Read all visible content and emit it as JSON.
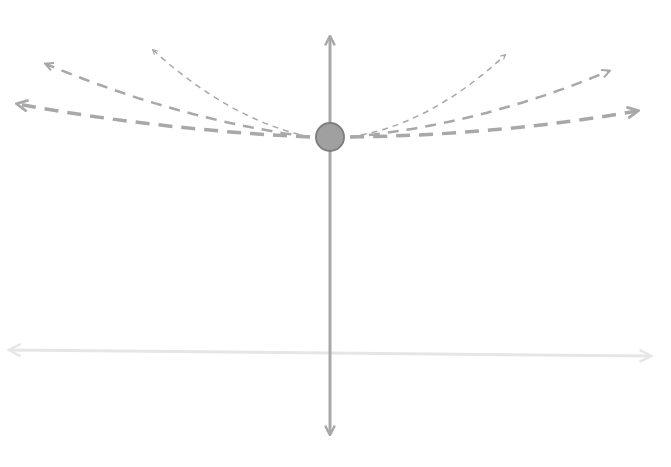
{
  "diagram": {
    "type": "vector-fan",
    "colors": {
      "background": "#ffffff",
      "axis_vertical": "#a8a8a8",
      "axis_horizontal": "#e6e6e6",
      "dashed_vectors": "#a8a8a8",
      "node_fill": "#a0a0a0",
      "node_stroke": "#808080"
    },
    "node": {
      "cx": 330,
      "cy": 137,
      "r": 14
    },
    "vertical_axis": {
      "x": 330,
      "y_top": 37,
      "y_bottom": 434
    },
    "horizontal_axis": {
      "x_left": 10,
      "y_left": 350,
      "x_right": 650,
      "y_right": 356
    },
    "vectors": [
      {
        "name": "left-low",
        "d": "M 310 137 Q 160 130 18 104",
        "width": 3.5,
        "dash": "14 9"
      },
      {
        "name": "left-mid",
        "d": "M 310 137 Q 180 120 46 64",
        "width": 2.5,
        "dash": "11 8"
      },
      {
        "name": "left-high",
        "d": "M 310 137 Q 230 120 153 50",
        "width": 1.5,
        "dash": "6 5"
      },
      {
        "name": "right-high",
        "d": "M 350 137 Q 430 125 505 55",
        "width": 1.5,
        "dash": "6 5"
      },
      {
        "name": "right-mid",
        "d": "M 350 137 Q 480 125 609 71",
        "width": 2.5,
        "dash": "11 8"
      },
      {
        "name": "right-low",
        "d": "M 350 137 Q 500 135 637 111",
        "width": 3.5,
        "dash": "14 9"
      }
    ]
  }
}
